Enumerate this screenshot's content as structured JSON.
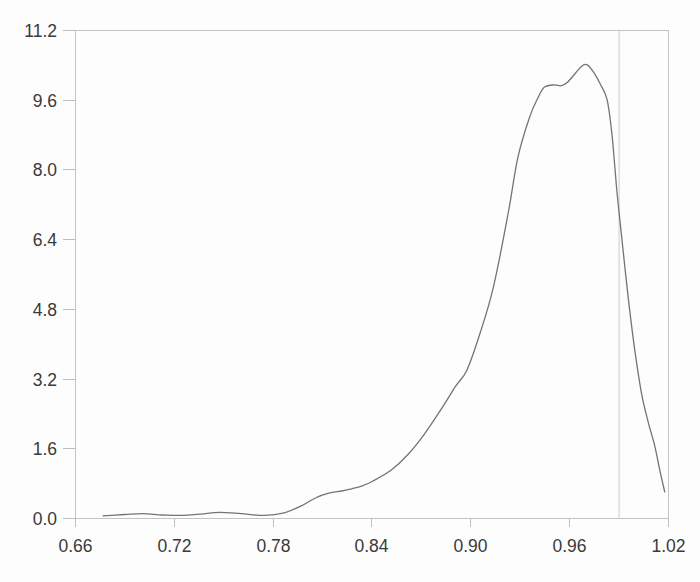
{
  "chart_data": {
    "type": "line",
    "title": "",
    "xlabel": "",
    "ylabel": "",
    "xlim": [
      0.66,
      1.02
    ],
    "ylim": [
      0.0,
      11.2
    ],
    "grid": false,
    "legend": "none",
    "frame": true,
    "x_ticks": [
      0.66,
      0.72,
      0.78,
      0.84,
      0.9,
      0.96,
      1.02
    ],
    "x_tick_labels": [
      "0.66",
      "0.72",
      "0.78",
      "0.84",
      "0.90",
      "0.96",
      "1.02"
    ],
    "y_ticks": [
      0.0,
      1.6,
      3.2,
      4.8,
      6.4,
      8.0,
      9.6,
      11.2
    ],
    "y_tick_labels": [
      "0.0",
      "1.6",
      "3.2",
      "4.8",
      "6.4",
      "8.0",
      "9.6",
      "11.2"
    ],
    "reference_line_x": 0.99,
    "series": [
      {
        "name": "density-curve",
        "points": [
          [
            0.677,
            0.05
          ],
          [
            0.69,
            0.08
          ],
          [
            0.701,
            0.1
          ],
          [
            0.713,
            0.07
          ],
          [
            0.724,
            0.06
          ],
          [
            0.736,
            0.09
          ],
          [
            0.748,
            0.13
          ],
          [
            0.761,
            0.1
          ],
          [
            0.775,
            0.06
          ],
          [
            0.787,
            0.12
          ],
          [
            0.797,
            0.27
          ],
          [
            0.806,
            0.46
          ],
          [
            0.814,
            0.57
          ],
          [
            0.822,
            0.62
          ],
          [
            0.828,
            0.67
          ],
          [
            0.834,
            0.73
          ],
          [
            0.841,
            0.85
          ],
          [
            0.852,
            1.1
          ],
          [
            0.862,
            1.45
          ],
          [
            0.872,
            1.92
          ],
          [
            0.882,
            2.48
          ],
          [
            0.891,
            3.02
          ],
          [
            0.898,
            3.4
          ],
          [
            0.906,
            4.25
          ],
          [
            0.914,
            5.3
          ],
          [
            0.923,
            7.0
          ],
          [
            0.929,
            8.3
          ],
          [
            0.936,
            9.2
          ],
          [
            0.941,
            9.64
          ],
          [
            0.945,
            9.89
          ],
          [
            0.951,
            9.94
          ],
          [
            0.955,
            9.92
          ],
          [
            0.959,
            10.0
          ],
          [
            0.964,
            10.22
          ],
          [
            0.968,
            10.38
          ],
          [
            0.971,
            10.4
          ],
          [
            0.975,
            10.22
          ],
          [
            0.979,
            9.95
          ],
          [
            0.983,
            9.6
          ],
          [
            0.986,
            8.8
          ],
          [
            0.989,
            7.5
          ],
          [
            0.992,
            6.4
          ],
          [
            0.996,
            5.0
          ],
          [
            1.0,
            3.8
          ],
          [
            1.004,
            2.85
          ],
          [
            1.008,
            2.2
          ],
          [
            1.012,
            1.65
          ],
          [
            1.015,
            1.1
          ],
          [
            1.018,
            0.6
          ]
        ]
      }
    ],
    "colors": {
      "curve": "#747474",
      "frame": "#c3c3c3",
      "tick": "#bdbdbd",
      "reference_line": "#cccccc",
      "label": "#3a3a3a",
      "background": "#fdfdfd"
    }
  }
}
